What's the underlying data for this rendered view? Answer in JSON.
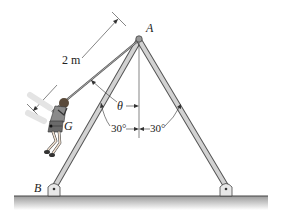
{
  "diagram": {
    "labels": {
      "apex": "A",
      "base_pin": "B",
      "center_of_gravity": "G",
      "rope_length": "2 m",
      "swing_angle": "θ",
      "left_leg_angle": "30°",
      "right_leg_angle": "30°"
    },
    "colors": {
      "frame": "#b8b8b8",
      "frame_edge": "#555555",
      "ground": "#9a9a9a",
      "line": "#333333"
    }
  }
}
